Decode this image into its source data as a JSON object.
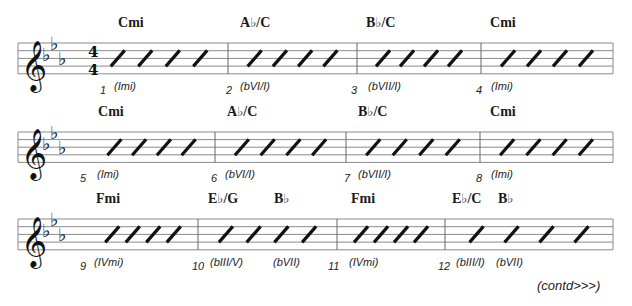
{
  "piece": {
    "key_signature": {
      "flats": [
        "Bb",
        "Eb",
        "Ab"
      ]
    },
    "time_signature": {
      "top": "4",
      "bottom": "4"
    },
    "continued_label": "(contd>>>)"
  },
  "systems": [
    {
      "staff": {
        "x1": 18,
        "x2": 613,
        "top": 43,
        "spacing": 7.7
      },
      "show_time_signature": true,
      "barlines": [
        228,
        357,
        481
      ],
      "measures": [
        {
          "number": "1",
          "start": 90,
          "end": 228,
          "slashes": 4,
          "chords": [
            {
              "root": "C",
              "accidental": "",
              "suffix": "mi",
              "x": 118
            }
          ],
          "romans": [
            {
              "text": "(Imi)",
              "x": 114
            }
          ],
          "number_x": 100
        },
        {
          "number": "2",
          "start": 228,
          "end": 357,
          "slashes": 4,
          "chords": [
            {
              "root": "A",
              "accidental": "♭",
              "suffix": "/C",
              "x": 240
            }
          ],
          "romans": [
            {
              "text": "(bVI/I)",
              "x": 240
            }
          ],
          "number_x": 226
        },
        {
          "number": "3",
          "start": 357,
          "end": 481,
          "slashes": 4,
          "chords": [
            {
              "root": "B",
              "accidental": "♭",
              "suffix": "/C",
              "x": 366
            }
          ],
          "romans": [
            {
              "text": "(bVII/I)",
              "x": 368
            }
          ],
          "number_x": 351
        },
        {
          "number": "4",
          "start": 481,
          "end": 613,
          "slashes": 4,
          "chords": [
            {
              "root": "C",
              "accidental": "",
              "suffix": "mi",
              "x": 490
            }
          ],
          "romans": [
            {
              "text": "(Imi)",
              "x": 491
            }
          ],
          "number_x": 476
        }
      ]
    },
    {
      "staff": {
        "x1": 18,
        "x2": 613,
        "top": 132,
        "spacing": 7.6
      },
      "show_time_signature": false,
      "barlines": [
        215,
        346,
        480
      ],
      "measures": [
        {
          "number": "5",
          "start": 88,
          "end": 215,
          "slashes": 4,
          "chords": [
            {
              "root": "C",
              "accidental": "",
              "suffix": "mi",
              "x": 98
            }
          ],
          "romans": [
            {
              "text": "(Imi)",
              "x": 97
            }
          ],
          "number_x": 80
        },
        {
          "number": "6",
          "start": 215,
          "end": 346,
          "slashes": 4,
          "chords": [
            {
              "root": "A",
              "accidental": "♭",
              "suffix": "/C",
              "x": 227
            }
          ],
          "romans": [
            {
              "text": "(bVI/I)",
              "x": 225
            }
          ],
          "number_x": 211
        },
        {
          "number": "7",
          "start": 346,
          "end": 480,
          "slashes": 4,
          "chords": [
            {
              "root": "B",
              "accidental": "♭",
              "suffix": "/C",
              "x": 358
            }
          ],
          "romans": [
            {
              "text": "(bVII/I)",
              "x": 358
            }
          ],
          "number_x": 344
        },
        {
          "number": "8",
          "start": 480,
          "end": 613,
          "slashes": 4,
          "chords": [
            {
              "root": "C",
              "accidental": "",
              "suffix": "mi",
              "x": 490
            }
          ],
          "romans": [
            {
              "text": "(Imi)",
              "x": 491
            }
          ],
          "number_x": 476
        }
      ]
    },
    {
      "staff": {
        "x1": 18,
        "x2": 613,
        "top": 219,
        "spacing": 7.7
      },
      "show_time_signature": false,
      "barlines": [
        198,
        337,
        445
      ],
      "measures": [
        {
          "number": "9",
          "start": 88,
          "end": 198,
          "slashes": 4,
          "chords": [
            {
              "root": "F",
              "accidental": "",
              "suffix": "mi",
              "x": 96
            }
          ],
          "romans": [
            {
              "text": "(IVmi)",
              "x": 94
            }
          ],
          "number_x": 80
        },
        {
          "number": "10",
          "start": 198,
          "end": 337,
          "slashes": 4,
          "chords": [
            {
              "root": "E",
              "accidental": "♭",
              "suffix": "/G",
              "x": 208
            },
            {
              "root": "B",
              "accidental": "♭",
              "suffix": "",
              "x": 274
            }
          ],
          "romans": [
            {
              "text": "(bIII/V)",
              "x": 210
            },
            {
              "text": "(bVII)",
              "x": 273
            }
          ],
          "number_x": 192
        },
        {
          "number": "11",
          "start": 337,
          "end": 445,
          "slashes": 4,
          "chords": [
            {
              "root": "F",
              "accidental": "",
              "suffix": "mi",
              "x": 351
            }
          ],
          "romans": [
            {
              "text": "(IVmi)",
              "x": 349
            }
          ],
          "number_x": 328
        },
        {
          "number": "12",
          "start": 445,
          "end": 613,
          "slashes": 4,
          "chords": [
            {
              "root": "E",
              "accidental": "♭",
              "suffix": "/C",
              "x": 452
            },
            {
              "root": "B",
              "accidental": "♭",
              "suffix": "",
              "x": 498
            }
          ],
          "romans": [
            {
              "text": "(bIII/I)",
              "x": 456
            },
            {
              "text": "(bVII)",
              "x": 496
            }
          ],
          "number_x": 438
        }
      ]
    }
  ],
  "colors": {
    "ink": "#111111",
    "staff_line": "#8a8a8a",
    "paper": "#ffffff"
  }
}
